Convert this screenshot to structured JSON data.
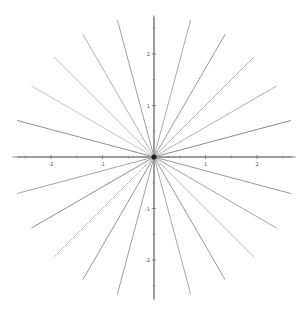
{
  "chart_data": {
    "type": "line",
    "title": "",
    "xlabel": "",
    "ylabel": "",
    "xlim": [
      -2.7,
      2.7
    ],
    "ylim": [
      -2.8,
      2.75
    ],
    "grid": false,
    "legend": null,
    "x_ticks": [
      -2,
      -1,
      1,
      2
    ],
    "x_tick_labels": [
      "-2",
      "-1",
      "1",
      "2"
    ],
    "y_ticks": [
      -2,
      -1,
      1,
      2
    ],
    "y_tick_labels": [
      "-2",
      "-1",
      "1",
      "2"
    ],
    "ray_length": 2.75,
    "angles_deg": [
      0,
      15,
      30,
      45,
      60,
      75,
      90,
      105,
      120,
      135,
      150,
      165,
      180,
      195,
      210,
      225,
      240,
      255,
      270,
      285,
      300,
      315,
      330,
      345
    ],
    "series": [
      {
        "name": "ray-0",
        "x": [
          0,
          2.75
        ],
        "y": [
          0,
          0.0
        ],
        "color": "#888888"
      },
      {
        "name": "ray-15",
        "x": [
          0,
          2.66
        ],
        "y": [
          0,
          0.71
        ],
        "color": "#8a8a8a"
      },
      {
        "name": "ray-30",
        "x": [
          0,
          2.38
        ],
        "y": [
          0,
          1.38
        ],
        "color": "#b0b0b0"
      },
      {
        "name": "ray-45",
        "x": [
          0,
          1.94
        ],
        "y": [
          0,
          1.94
        ],
        "color": "#b8b8b8"
      },
      {
        "name": "ray-60",
        "x": [
          0,
          1.38
        ],
        "y": [
          0,
          2.38
        ],
        "color": "#999999"
      },
      {
        "name": "ray-75",
        "x": [
          0,
          0.71
        ],
        "y": [
          0,
          2.66
        ],
        "color": "#aaaaaa"
      },
      {
        "name": "ray-90",
        "x": [
          0,
          0.0
        ],
        "y": [
          0,
          2.75
        ],
        "color": "#888888"
      },
      {
        "name": "ray-105",
        "x": [
          0,
          -0.71
        ],
        "y": [
          0,
          2.66
        ],
        "color": "#a0a0a0"
      },
      {
        "name": "ray-120",
        "x": [
          0,
          -1.38
        ],
        "y": [
          0,
          2.38
        ],
        "color": "#b5b5b5"
      },
      {
        "name": "ray-135",
        "x": [
          0,
          -1.94
        ],
        "y": [
          0,
          1.94
        ],
        "color": "#c2c2c2"
      },
      {
        "name": "ray-150",
        "x": [
          0,
          -2.38
        ],
        "y": [
          0,
          1.38
        ],
        "color": "#c8c8c8"
      },
      {
        "name": "ray-165",
        "x": [
          0,
          -2.66
        ],
        "y": [
          0,
          0.71
        ],
        "color": "#909090"
      },
      {
        "name": "ray-180",
        "x": [
          0,
          -2.75
        ],
        "y": [
          0,
          0.0
        ],
        "color": "#888888"
      },
      {
        "name": "ray-195",
        "x": [
          0,
          -2.66
        ],
        "y": [
          0,
          -0.71
        ],
        "color": "#a5a5a5"
      },
      {
        "name": "ray-210",
        "x": [
          0,
          -2.38
        ],
        "y": [
          0,
          -1.38
        ],
        "color": "#909090"
      },
      {
        "name": "ray-225",
        "x": [
          0,
          -1.94
        ],
        "y": [
          0,
          -1.94
        ],
        "color": "#c5c5c5"
      },
      {
        "name": "ray-240",
        "x": [
          0,
          -1.38
        ],
        "y": [
          0,
          -2.38
        ],
        "color": "#959595"
      },
      {
        "name": "ray-255",
        "x": [
          0,
          -0.71
        ],
        "y": [
          0,
          -2.66
        ],
        "color": "#a0a0a0"
      },
      {
        "name": "ray-270",
        "x": [
          0,
          0.0
        ],
        "y": [
          0,
          -2.75
        ],
        "color": "#888888"
      },
      {
        "name": "ray-285",
        "x": [
          0,
          0.71
        ],
        "y": [
          0,
          -2.66
        ],
        "color": "#a8a8a8"
      },
      {
        "name": "ray-300",
        "x": [
          0,
          1.38
        ],
        "y": [
          0,
          -2.38
        ],
        "color": "#999999"
      },
      {
        "name": "ray-315",
        "x": [
          0,
          1.94
        ],
        "y": [
          0,
          -1.94
        ],
        "color": "#c0c0c0"
      },
      {
        "name": "ray-330",
        "x": [
          0,
          2.38
        ],
        "y": [
          0,
          -1.38
        ],
        "color": "#a5a5a5"
      },
      {
        "name": "ray-345",
        "x": [
          0,
          2.66
        ],
        "y": [
          0,
          -0.71
        ],
        "color": "#999999"
      }
    ]
  },
  "layout": {
    "origin_px": [
      154,
      157
    ],
    "unit_px": 51.5,
    "axis_color": "#777777",
    "x_axis_extent_px": [
      17,
      292
    ],
    "y_axis_extent_px": [
      17,
      300
    ]
  }
}
